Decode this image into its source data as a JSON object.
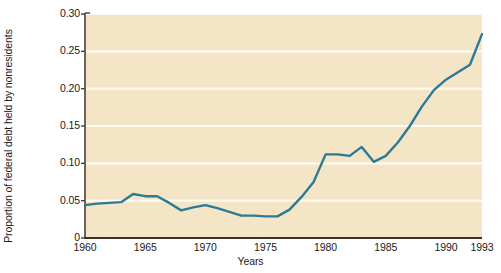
{
  "chart_data": {
    "type": "line",
    "title": "",
    "xlabel": "Years",
    "ylabel": "Proportion of federal debt held by nonresidents",
    "xlim": [
      1960,
      1993
    ],
    "ylim": [
      0,
      0.3
    ],
    "grid": "horizontal",
    "legend": "none",
    "line_color": "#2c7a96",
    "plot_background": "#f3e5c6",
    "gridline_color": "#fdfaf2",
    "y_ticks": [
      "0",
      "0.05",
      "0.10",
      "0.15",
      "0.20",
      "0.25",
      "0.30"
    ],
    "y_tick_values": [
      0,
      0.05,
      0.1,
      0.15,
      0.2,
      0.25,
      0.3
    ],
    "x_ticks": [
      "1960",
      "1965",
      "1970",
      "1975",
      "1980",
      "1985",
      "1990",
      "1993"
    ],
    "x_tick_values": [
      1960,
      1965,
      1970,
      1975,
      1980,
      1985,
      1990,
      1993
    ],
    "x": [
      1960,
      1961,
      1962,
      1963,
      1964,
      1965,
      1966,
      1967,
      1968,
      1969,
      1970,
      1971,
      1972,
      1973,
      1974,
      1975,
      1976,
      1977,
      1978,
      1979,
      1980,
      1981,
      1982,
      1983,
      1984,
      1985,
      1986,
      1987,
      1988,
      1989,
      1990,
      1991,
      1992,
      1993
    ],
    "values": [
      0.044,
      0.046,
      0.047,
      0.048,
      0.059,
      0.056,
      0.056,
      0.047,
      0.037,
      0.041,
      0.044,
      0.04,
      0.035,
      0.03,
      0.03,
      0.029,
      0.029,
      0.038,
      0.055,
      0.075,
      0.112,
      0.112,
      0.11,
      0.122,
      0.102,
      0.11,
      0.128,
      0.15,
      0.176,
      0.198,
      0.212,
      0.222,
      0.232,
      0.273
    ]
  }
}
